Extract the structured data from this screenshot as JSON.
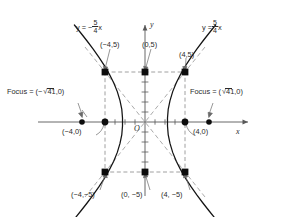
{
  "figure": {
    "kind": "hyperbola-graph",
    "equation_implied": "x^2/16 - y^2/25 = 1",
    "axis_labels": {
      "x": "x",
      "y": "y",
      "origin": "O"
    },
    "asymptotes": [
      {
        "name": "left-asymptote",
        "prefix": "y = −",
        "numerator": "5",
        "denominator": "4",
        "suffix": "x",
        "slope": -1.25
      },
      {
        "name": "right-asymptote",
        "prefix": "y =",
        "numerator": "5",
        "denominator": "4",
        "suffix": "x",
        "slope": 1.25
      }
    ],
    "foci": [
      {
        "name": "left-focus",
        "prefix": "Focus = (−",
        "radicand": "41",
        "suffix": ",0)",
        "x": -6.403,
        "y": 0
      },
      {
        "name": "right-focus",
        "prefix": "Focus = (",
        "radicand": "41",
        "suffix": ",0)",
        "x": 6.403,
        "y": 0
      }
    ],
    "points": [
      {
        "name": "corner-top-left",
        "label": "(−4,5)",
        "x": -4,
        "y": 5,
        "marker": "square"
      },
      {
        "name": "midpoint-top",
        "label": "(0,5)",
        "x": 0,
        "y": 5,
        "marker": "square"
      },
      {
        "name": "corner-top-right",
        "label": "(4,5)",
        "x": 4,
        "y": 5,
        "marker": "square"
      },
      {
        "name": "vertex-left",
        "label": "(−4,0)",
        "x": -4,
        "y": 0,
        "marker": "dot"
      },
      {
        "name": "vertex-right",
        "label": "(4,0)",
        "x": 4,
        "y": 0,
        "marker": "dot"
      },
      {
        "name": "corner-bottom-left",
        "label": "(−4,−5)",
        "x": -4,
        "y": -5,
        "marker": "square"
      },
      {
        "name": "midpoint-bottom",
        "label": "(0, −5)",
        "x": 0,
        "y": -5,
        "marker": "square"
      },
      {
        "name": "corner-bottom-right",
        "label": "(4, −5)",
        "x": 4,
        "y": -5,
        "marker": "square"
      }
    ],
    "reference_box": {
      "x_range": [
        -4,
        4
      ],
      "y_range": [
        -5,
        5
      ],
      "style": "dashed"
    },
    "colors": {
      "curve": "#141414",
      "axis": "#555555",
      "dashed": "#9a9a9a",
      "asymptote": "#9a9a9a",
      "text": "#2b2b2b"
    },
    "scale": {
      "origin_px": [
        145,
        122
      ],
      "px_per_unit_x": 10,
      "px_per_unit_y": 10
    }
  }
}
